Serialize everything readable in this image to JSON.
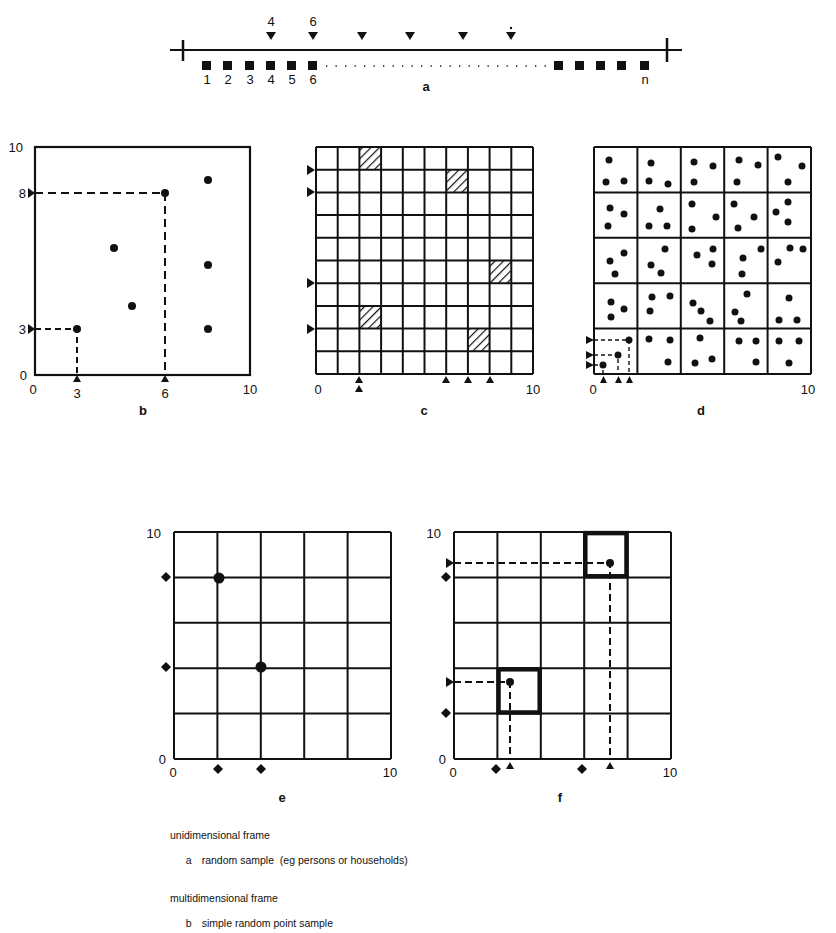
{
  "figure": {
    "panel_a": {
      "label": "a",
      "unit_labels": [
        "1",
        "2",
        "3",
        "4",
        "5",
        "6"
      ],
      "end_label": "n",
      "selected_labels": [
        "4",
        "6"
      ],
      "selected_count_markers": 6
    },
    "panel_b": {
      "label": "b",
      "axis": {
        "min": "0",
        "max": "10"
      },
      "x_ticks": [
        "0",
        "3",
        "6",
        "10"
      ],
      "y_ticks": [
        "0",
        "3",
        "8",
        "10"
      ],
      "points": [
        [
          3,
          3
        ],
        [
          6,
          8
        ],
        [
          4.3,
          6
        ],
        [
          4.9,
          3.4
        ],
        [
          8.1,
          9.2
        ],
        [
          8.1,
          5.3
        ],
        [
          8.1,
          3
        ]
      ],
      "highlighted": [
        [
          3,
          3
        ],
        [
          6,
          8
        ]
      ]
    },
    "panel_c": {
      "label": "c",
      "axis": {
        "min": "0",
        "max": "10"
      },
      "grid": 10,
      "hatched_cells_row_col_from_top": [
        [
          0,
          2
        ],
        [
          1,
          6
        ],
        [
          5,
          8
        ],
        [
          7,
          2
        ],
        [
          8,
          7
        ]
      ],
      "left_markers_at_lines_from_top": [
        1,
        2,
        6,
        8
      ],
      "bottom_markers_at_x": [
        2,
        6,
        7,
        8
      ],
      "double_marker_at_x": 2
    },
    "panel_d": {
      "label": "d",
      "axis": {
        "min": "0",
        "max": "10"
      },
      "grid": 5,
      "points_per_cell": 3
    },
    "panel_e": {
      "label": "e",
      "axis": {
        "min": "0",
        "max": "10"
      },
      "grid": 5,
      "points": [
        [
          2,
          8
        ],
        [
          4,
          4
        ]
      ]
    },
    "panel_f": {
      "label": "f",
      "axis": {
        "min": "0",
        "max": "10"
      },
      "grid": 5,
      "highlighted_cells": [
        [
          1,
          2
        ],
        [
          3,
          4
        ]
      ],
      "points": [
        [
          2.6,
          3.6
        ],
        [
          7.1,
          8.6
        ]
      ]
    }
  },
  "caption": {
    "group1_title": "unidimensional frame",
    "group1_items": [
      {
        "key": "a",
        "text": "random sample  (eg persons or households)"
      }
    ],
    "group2_title": "multidimensional frame",
    "group2_items": [
      {
        "key": "b",
        "text": "simple random point sample"
      }
    ]
  }
}
